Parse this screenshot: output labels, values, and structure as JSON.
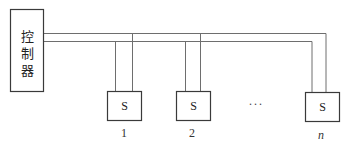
{
  "controller": {
    "label_chars": [
      "控",
      "制",
      "器"
    ]
  },
  "slaves": [
    {
      "box_label": "S",
      "index_label": "1"
    },
    {
      "box_label": "S",
      "index_label": "2"
    },
    {
      "box_label": "S",
      "index_label": "n"
    }
  ],
  "ellipsis": "···",
  "colors": {
    "line": "#6e6e6e",
    "box_border": "#3a3a3a",
    "text": "#222222"
  }
}
